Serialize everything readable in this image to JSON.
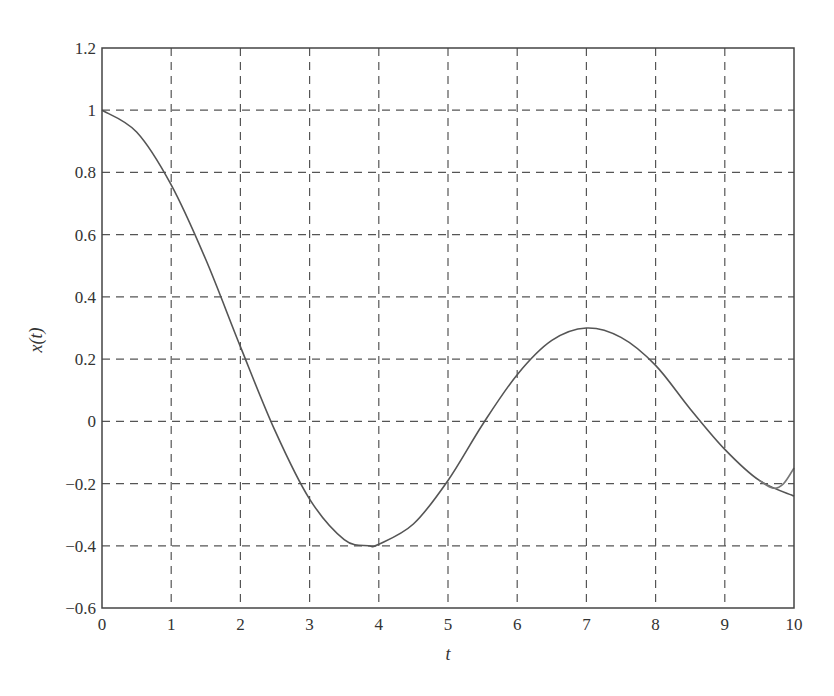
{
  "chart_data": {
    "type": "line",
    "title": "",
    "xlabel": "t",
    "ylabel": "x(t)",
    "xlim": [
      0,
      10
    ],
    "ylim": [
      -0.6,
      1.2
    ],
    "xticks": [
      "0",
      "1",
      "2",
      "3",
      "4",
      "5",
      "6",
      "7",
      "8",
      "9",
      "10"
    ],
    "yticks": [
      "1.2",
      "1",
      "0.8",
      "0.6",
      "0.4",
      "0.2",
      "0",
      "−0.2",
      "−0.4",
      "−0.6"
    ],
    "grid": true,
    "grid_style": "dashed",
    "legend": null,
    "series": [
      {
        "name": "x(t)",
        "color": "#555555",
        "x": [
          0,
          0.5,
          1,
          1.5,
          2,
          2.5,
          3,
          3.5,
          3.85,
          4,
          4.5,
          5,
          5.5,
          6,
          6.5,
          7,
          7.5,
          8,
          8.5,
          9,
          9.5,
          10
        ],
        "y": [
          1.0,
          0.93,
          0.76,
          0.52,
          0.24,
          -0.03,
          -0.25,
          -0.38,
          -0.4,
          -0.395,
          -0.33,
          -0.19,
          -0.01,
          0.15,
          0.26,
          0.3,
          0.27,
          0.18,
          0.04,
          -0.09,
          -0.19,
          -0.24
        ]
      },
      {
        "name": "x(t) approx",
        "color": "#777777",
        "x": [
          9.5,
          9.7,
          9.85,
          10
        ],
        "y": [
          -0.19,
          -0.215,
          -0.2,
          -0.15
        ]
      }
    ]
  },
  "axes": {
    "xlabel": "t",
    "ylabel": "x(t)"
  }
}
